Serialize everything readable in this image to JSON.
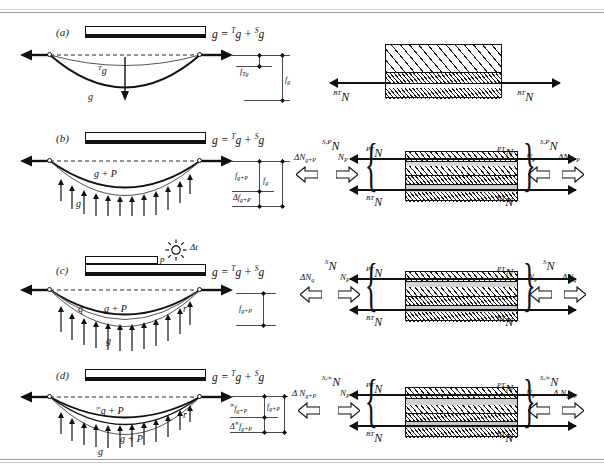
{
  "figure": {
    "equation": "g = ᵀg + ˢg",
    "panels": [
      {
        "id": "a",
        "label": "(a)",
        "girder_equation_lhs": "g",
        "girder_equation_rhs_1": "T",
        "girder_equation_rhs_2": "g",
        "girder_equation_rhs_3": "S",
        "girder_equation_rhs_4": "g",
        "curve_labels": [
          "Tg",
          "g"
        ],
        "curve_label_upper_pre": "T",
        "curve_label_upper_base": "g",
        "curve_label_lower": "g",
        "dim_labels": [
          "f_Tg",
          "f_g"
        ],
        "dim_upper_base": "f",
        "dim_upper_sub": "Tg",
        "dim_lower_base": "f",
        "dim_lower_sub": "g",
        "section_force_left_pre": "BT",
        "section_force_left_base": "N",
        "section_force_right_pre": "BT",
        "section_force_right_base": "N"
      },
      {
        "id": "b",
        "label": "(b)",
        "curve_label_upper": "g + P",
        "curve_label_lower": "g",
        "dim_1_base": "f",
        "dim_1_sub": "g+P",
        "dim_2_base": "f",
        "dim_2_sub": "g",
        "dim_3_base": "Δf",
        "dim_3_sub": "g+P",
        "force_top_pre": "S,P",
        "force_top_base": "N",
        "force_delta_base": "ΔN",
        "force_delta_sub": "g+P",
        "force_np_base": "N",
        "force_np_sub": "P",
        "section_pt_pre": "PT",
        "section_pt_base": "N",
        "section_bt_pre": "BT",
        "section_bt_base": "N"
      },
      {
        "id": "c",
        "label": "(c)",
        "slab_load_label": "p",
        "temperature_label": "Δt",
        "sun_icon": "sun-icon",
        "curve_label_q": "q",
        "curve_label_r": "r",
        "curve_label_upper": "g + P",
        "curve_label_lower": "g",
        "dim_1_base": "f",
        "dim_1_sub": "g+P",
        "force_top_pre": "S",
        "force_top_base": "N",
        "force_delta_base": "ΔN",
        "force_delta_sub": "q",
        "force_np_base": "N",
        "force_np_sub": "P",
        "section_pt_pre": "PT",
        "section_pt_base": "N",
        "section_bt_pre": "BT",
        "section_bt_base": "N"
      },
      {
        "id": "d",
        "label": "(d)",
        "curve_label_r": "r",
        "curve_label_top_pre": "∞",
        "curve_label_top_base": "g + P",
        "curve_label_mid": "g + P",
        "curve_label_lower": "g",
        "dim_1_pre": "∞",
        "dim_1_base": "f",
        "dim_1_sub": "g+P",
        "dim_2_base": "f",
        "dim_2_sub": "g+P",
        "dim_3_pre": "∞",
        "dim_3_base": "Δ",
        "dim_3_base2": "f",
        "dim_3_sub": "g+P",
        "force_top_pre": "S,∞",
        "force_top_base": "N",
        "force_delta_pre": "∞",
        "force_delta_base": "Δ  N",
        "force_delta_sub": "g+P",
        "force_np_base": "N",
        "force_np_sub": "P",
        "section_pt_pre": "PT",
        "section_pt_base": "N",
        "section_bt_pre": "BT",
        "section_bt_base": "N"
      }
    ]
  },
  "colors": {
    "ink": "#111111",
    "rule": "#9a9a9a",
    "hatch": "#1a1a1a",
    "paper": "#ffffff"
  }
}
